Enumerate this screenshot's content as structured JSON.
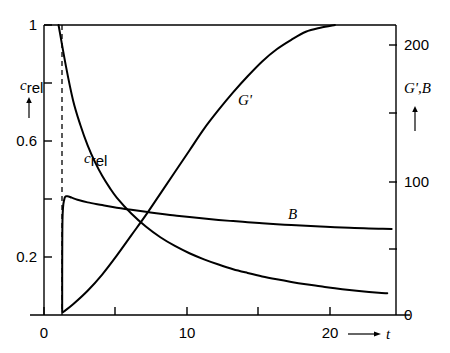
{
  "chart_data": {
    "type": "line",
    "title": "",
    "xlabel": "t",
    "ylabel_left": "c_rel",
    "ylabel_right": "G',B",
    "xlim": [
      0,
      24.2
    ],
    "ylim_left": [
      0,
      1.0
    ],
    "ylim_right": [
      0,
      215
    ],
    "grid": false,
    "legend": "inline-annotations",
    "x_ticks": [
      0,
      5,
      10,
      15,
      20
    ],
    "x_tick_labels": [
      "0",
      "",
      "10",
      "",
      "20"
    ],
    "y_ticks_left": [
      0,
      0.2,
      0.4,
      0.6,
      0.8,
      1
    ],
    "y_tick_labels_left": [
      "",
      "0.2",
      "",
      "0.6",
      "",
      "1"
    ],
    "y_ticks_right": [
      0,
      50,
      100,
      150,
      200
    ],
    "y_tick_labels_right": [
      "0",
      "",
      "100",
      "",
      "200"
    ],
    "annotations": [
      {
        "text": "c_rel",
        "x": 4.0,
        "y_left": 0.5
      },
      {
        "text": "G'",
        "x": 13.6,
        "y_right": 140
      },
      {
        "text": "B",
        "x": 17.0,
        "y_right": 78
      }
    ],
    "vertical_marker": {
      "x": 1.25,
      "style": "dashed",
      "label": ""
    },
    "series": [
      {
        "name": "c_rel",
        "axis": "left",
        "points": [
          [
            1.0,
            1.0
          ],
          [
            1.5,
            0.86
          ],
          [
            2.0,
            0.74
          ],
          [
            2.5,
            0.655
          ],
          [
            3.0,
            0.585
          ],
          [
            3.5,
            0.528
          ],
          [
            4.0,
            0.48
          ],
          [
            4.5,
            0.44
          ],
          [
            5.0,
            0.405
          ],
          [
            6.0,
            0.35
          ],
          [
            7.0,
            0.305
          ],
          [
            8.0,
            0.268
          ],
          [
            9.0,
            0.238
          ],
          [
            10.0,
            0.213
          ],
          [
            11.0,
            0.192
          ],
          [
            12.0,
            0.174
          ],
          [
            13.0,
            0.158
          ],
          [
            14.0,
            0.145
          ],
          [
            15.0,
            0.133
          ],
          [
            16.0,
            0.123
          ],
          [
            17.0,
            0.114
          ],
          [
            18.0,
            0.106
          ],
          [
            19.0,
            0.099
          ],
          [
            20.0,
            0.092
          ],
          [
            21.0,
            0.086
          ],
          [
            22.0,
            0.081
          ],
          [
            23.0,
            0.077
          ],
          [
            23.6,
            0.075
          ]
        ]
      },
      {
        "name": "G'",
        "axis": "right",
        "points": [
          [
            1.3,
            2
          ],
          [
            2.0,
            8
          ],
          [
            3.0,
            18
          ],
          [
            4.0,
            30
          ],
          [
            5.0,
            44
          ],
          [
            6.0,
            59
          ],
          [
            7.0,
            74
          ],
          [
            8.0,
            90
          ],
          [
            9.0,
            106
          ],
          [
            10.0,
            122
          ],
          [
            11.0,
            138
          ],
          [
            12.0,
            152
          ],
          [
            13.0,
            165
          ],
          [
            14.0,
            177
          ],
          [
            15.0,
            188
          ],
          [
            16.0,
            197
          ],
          [
            17.0,
            204
          ],
          [
            18.0,
            210
          ],
          [
            19.0,
            213
          ],
          [
            20.0,
            215
          ]
        ]
      },
      {
        "name": "B",
        "axis": "right",
        "points": [
          [
            1.25,
            2
          ],
          [
            1.27,
            70
          ],
          [
            1.4,
            86
          ],
          [
            1.6,
            88
          ],
          [
            1.9,
            87
          ],
          [
            2.3,
            85.5
          ],
          [
            3.0,
            83.5
          ],
          [
            4.0,
            81.5
          ],
          [
            5.0,
            79.5
          ],
          [
            6.0,
            78
          ],
          [
            7.0,
            76.5
          ],
          [
            8.0,
            75
          ],
          [
            9.0,
            73.8
          ],
          [
            10.0,
            72.6
          ],
          [
            11.0,
            71.5
          ],
          [
            12.0,
            70.5
          ],
          [
            13.0,
            69.6
          ],
          [
            14.0,
            68.8
          ],
          [
            15.0,
            68.0
          ],
          [
            16.0,
            67.3
          ],
          [
            17.0,
            66.7
          ],
          [
            18.0,
            66.1
          ],
          [
            19.0,
            65.6
          ],
          [
            20.0,
            65.1
          ],
          [
            21.0,
            64.7
          ],
          [
            22.0,
            64.3
          ],
          [
            23.0,
            64.0
          ],
          [
            23.9,
            63.7
          ]
        ]
      }
    ]
  },
  "labels": {
    "x_axis_symbol": "t",
    "y_left_symbol_main": "c",
    "y_left_symbol_sub": "rel",
    "y_right_symbol": "G',B",
    "curve_crel_main": "c",
    "curve_crel_sub": "rel",
    "curve_gprime": "G'",
    "curve_b": "B",
    "tick_x_0": "0",
    "tick_x_10": "10",
    "tick_x_20": "20",
    "tick_left_1": "1",
    "tick_left_06": "0.6",
    "tick_left_02": "0.2",
    "tick_right_0": "0",
    "tick_right_100": "100",
    "tick_right_200": "200"
  },
  "colors": {
    "ink": "#000000",
    "background": "#ffffff"
  }
}
